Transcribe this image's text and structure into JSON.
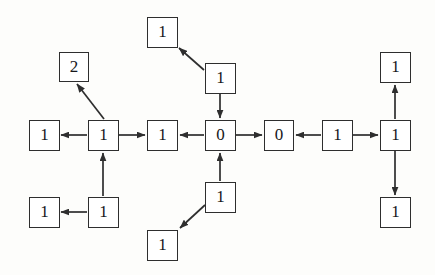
{
  "diagram": {
    "type": "node-link-graph",
    "canvas": {
      "width": 435,
      "height": 275
    },
    "style": {
      "node_fill": "#ffffff",
      "node_stroke": "#2e2e2e",
      "edge_stroke": "#2e2e2e",
      "background": "#fdfdfb",
      "node_width": 30,
      "node_height": 30
    },
    "nodes": [
      {
        "id": "n_left_outer",
        "label": "1",
        "x": 29,
        "y": 120
      },
      {
        "id": "n_left_hub",
        "label": "1",
        "x": 88,
        "y": 120
      },
      {
        "id": "n_two",
        "label": "2",
        "x": 59,
        "y": 52
      },
      {
        "id": "n_left_low_out",
        "label": "1",
        "x": 29,
        "y": 197
      },
      {
        "id": "n_left_low_hub",
        "label": "1",
        "x": 88,
        "y": 197
      },
      {
        "id": "n_mid_left",
        "label": "1",
        "x": 147,
        "y": 120
      },
      {
        "id": "n_zero_a",
        "label": "0",
        "x": 205,
        "y": 120
      },
      {
        "id": "n_zero_b",
        "label": "0",
        "x": 264,
        "y": 120
      },
      {
        "id": "n_top_upper",
        "label": "1",
        "x": 147,
        "y": 17
      },
      {
        "id": "n_top_mid",
        "label": "1",
        "x": 205,
        "y": 63
      },
      {
        "id": "n_bot_mid",
        "label": "1",
        "x": 205,
        "y": 182
      },
      {
        "id": "n_bot_lower",
        "label": "1",
        "x": 147,
        "y": 230
      },
      {
        "id": "n_right_mid",
        "label": "1",
        "x": 322,
        "y": 120
      },
      {
        "id": "n_right_hub",
        "label": "1",
        "x": 380,
        "y": 120
      },
      {
        "id": "n_right_top",
        "label": "1",
        "x": 380,
        "y": 52
      },
      {
        "id": "n_right_bottom",
        "label": "1",
        "x": 380,
        "y": 197
      }
    ],
    "edges": [
      {
        "id": "e1",
        "from": "n_left_hub",
        "to": "n_left_outer",
        "direction": "left"
      },
      {
        "id": "e2",
        "from": "n_left_hub",
        "to": "n_two",
        "direction": "up-left-diagonal"
      },
      {
        "id": "e3",
        "from": "n_left_hub",
        "to": "n_mid_left",
        "direction": "right"
      },
      {
        "id": "e4",
        "from": "n_left_low_hub",
        "to": "n_left_hub",
        "direction": "up"
      },
      {
        "id": "e5",
        "from": "n_left_low_hub",
        "to": "n_left_low_out",
        "direction": "left"
      },
      {
        "id": "e6",
        "from": "n_zero_a",
        "to": "n_mid_left",
        "direction": "left"
      },
      {
        "id": "e7",
        "from": "n_zero_a",
        "to": "n_zero_b",
        "direction": "right"
      },
      {
        "id": "e8",
        "from": "n_top_mid",
        "to": "n_top_upper",
        "direction": "up-left-diagonal"
      },
      {
        "id": "e9",
        "from": "n_top_mid",
        "to": "n_zero_a",
        "direction": "down"
      },
      {
        "id": "e10",
        "from": "n_bot_mid",
        "to": "n_zero_a",
        "direction": "up"
      },
      {
        "id": "e11",
        "from": "n_bot_mid",
        "to": "n_bot_lower",
        "direction": "down-left-diagonal"
      },
      {
        "id": "e12",
        "from": "n_right_mid",
        "to": "n_zero_b",
        "direction": "left"
      },
      {
        "id": "e13",
        "from": "n_right_mid",
        "to": "n_right_hub",
        "direction": "right"
      },
      {
        "id": "e14",
        "from": "n_right_hub",
        "to": "n_right_top",
        "direction": "up"
      },
      {
        "id": "e15",
        "from": "n_right_hub",
        "to": "n_right_bottom",
        "direction": "down"
      }
    ]
  }
}
